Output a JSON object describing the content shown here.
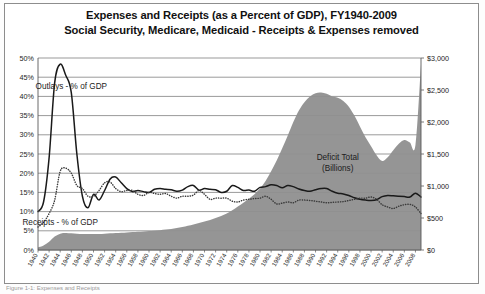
{
  "figure": {
    "title_line1": "Expenses and Receipts (as a Percent of GDP), FY1940-2009",
    "title_line2": "Social Security, Medicare, Medicaid - Receipts & Expenses removed",
    "caption": "Figure 1-1: Expenses and Receipts"
  },
  "colors": {
    "area_fill": "#8f8f8f",
    "outlays_line": "#1a1a1a",
    "receipts_line": "#3a3a3a",
    "gridline": "#6f6f6f",
    "axis": "#5a5a5a",
    "frame": "#8d8d8d",
    "background": "#ffffff"
  },
  "chart_data": {
    "type": "line",
    "title": "Expenses and Receipts (as a Percent of GDP), FY1940-2009",
    "subtitle": "Social Security, Medicare, Medicaid - Receipts & Expenses removed",
    "xlabel": "",
    "ylabel": "",
    "grid": true,
    "legend_position": "inline-annotations",
    "xlim": [
      1940,
      2009
    ],
    "x_tick_step": 2,
    "x_tick_labels": [
      "1940",
      "1942",
      "1944",
      "1946",
      "1948",
      "1950",
      "1952",
      "1954",
      "1956",
      "1958",
      "1960",
      "1962",
      "1964",
      "1966",
      "1968",
      "1970",
      "1972",
      "1974",
      "1976",
      "1978",
      "1980",
      "1982",
      "1984",
      "1986",
      "1988",
      "1990",
      "1992",
      "1994",
      "1996",
      "1998",
      "2000",
      "2002",
      "2004",
      "2006",
      "2008"
    ],
    "left_axis": {
      "label": "",
      "ylim": [
        0,
        50
      ],
      "tick_step": 5,
      "tick_labels": [
        "0%",
        "5%",
        "10%",
        "15%",
        "20%",
        "25%",
        "30%",
        "35%",
        "40%",
        "45%",
        "50%"
      ],
      "unit": "percent of GDP"
    },
    "right_axis": {
      "label": "",
      "ylim": [
        0,
        3000
      ],
      "tick_step": 500,
      "tick_labels": [
        "$0",
        "$500",
        "$1,000",
        "$1,500",
        "$2,000",
        "$2,500",
        "$3,000"
      ],
      "unit": "Billions of dollars"
    },
    "annotations": [
      {
        "text": "Outlays - % of GDP",
        "x": 1946,
        "y": 42
      },
      {
        "text": "Receipts - % of GDP",
        "x": 1944,
        "y": 6.5
      },
      {
        "text": "Deficit Total",
        "x": 1994,
        "y": 23.5
      },
      {
        "text": "(Billions)",
        "x": 1994,
        "y": 20.5
      }
    ],
    "x": [
      1940,
      1941,
      1942,
      1943,
      1944,
      1945,
      1946,
      1947,
      1948,
      1949,
      1950,
      1951,
      1952,
      1953,
      1954,
      1955,
      1956,
      1957,
      1958,
      1959,
      1960,
      1961,
      1962,
      1963,
      1964,
      1965,
      1966,
      1967,
      1968,
      1969,
      1970,
      1971,
      1972,
      1973,
      1974,
      1975,
      1976,
      1977,
      1978,
      1979,
      1980,
      1981,
      1982,
      1983,
      1984,
      1985,
      1986,
      1987,
      1988,
      1989,
      1990,
      1991,
      1992,
      1993,
      1994,
      1995,
      1996,
      1997,
      1998,
      1999,
      2000,
      2001,
      2002,
      2003,
      2004,
      2005,
      2006,
      2007,
      2008,
      2009
    ],
    "series": [
      {
        "name": "Outlays - % of GDP",
        "axis": "left",
        "style": "solid",
        "color": "#1a1a1a",
        "values": [
          10.0,
          12.5,
          24.0,
          43.5,
          48.4,
          45.5,
          41.0,
          25.0,
          14.0,
          11.0,
          14.5,
          13.0,
          15.5,
          18.5,
          19.0,
          17.5,
          16.0,
          15.2,
          15.5,
          15.2,
          15.0,
          15.8,
          16.0,
          15.8,
          15.7,
          15.3,
          15.6,
          16.5,
          16.8,
          15.6,
          16.0,
          15.8,
          15.7,
          15.0,
          15.3,
          16.8,
          16.3,
          15.5,
          15.6,
          15.3,
          16.3,
          16.5,
          17.0,
          16.8,
          16.2,
          16.8,
          16.5,
          15.9,
          15.5,
          15.3,
          15.7,
          16.0,
          16.0,
          15.3,
          14.8,
          14.6,
          14.2,
          13.6,
          13.2,
          13.0,
          12.9,
          13.1,
          13.9,
          14.2,
          14.1,
          14.0,
          13.9,
          13.8,
          14.8,
          13.8
        ]
      },
      {
        "name": "Receipts - % of GDP",
        "axis": "left",
        "style": "dotted",
        "color": "#3a3a3a",
        "values": [
          6.0,
          7.2,
          9.5,
          13.0,
          20.5,
          21.3,
          20.0,
          16.8,
          16.0,
          14.0,
          14.0,
          15.5,
          17.5,
          17.7,
          16.0,
          15.2,
          15.5,
          15.5,
          14.5,
          14.2,
          15.0,
          14.7,
          14.5,
          14.7,
          14.0,
          13.5,
          14.0,
          14.0,
          14.3,
          15.5,
          14.5,
          13.2,
          13.5,
          13.5,
          13.5,
          12.7,
          12.5,
          13.0,
          13.2,
          13.4,
          13.5,
          14.0,
          13.2,
          12.0,
          12.2,
          12.5,
          12.3,
          13.0,
          13.0,
          12.9,
          12.7,
          12.5,
          12.3,
          12.4,
          12.5,
          12.6,
          12.9,
          13.2,
          13.5,
          13.5,
          13.8,
          13.2,
          11.8,
          11.2,
          10.8,
          11.4,
          11.8,
          11.9,
          11.2,
          9.5
        ]
      },
      {
        "name": "Deficit Total (Billions)",
        "axis": "right",
        "style": "area",
        "color": "#8f8f8f",
        "values": [
          40,
          70,
          130,
          210,
          255,
          265,
          260,
          255,
          250,
          250,
          250,
          250,
          255,
          260,
          265,
          270,
          275,
          280,
          285,
          290,
          295,
          300,
          310,
          320,
          330,
          345,
          360,
          380,
          400,
          420,
          445,
          470,
          500,
          530,
          570,
          620,
          680,
          740,
          800,
          870,
          960,
          1080,
          1230,
          1400,
          1590,
          1790,
          2000,
          2180,
          2310,
          2400,
          2450,
          2460,
          2440,
          2400,
          2380,
          2330,
          2240,
          2100,
          1930,
          1760,
          1620,
          1480,
          1390,
          1450,
          1560,
          1660,
          1720,
          1680,
          1640,
          2900
        ]
      }
    ]
  }
}
